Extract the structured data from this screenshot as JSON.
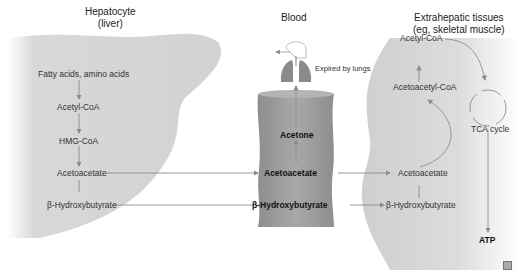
{
  "headers": {
    "liver": [
      "Hepatocyte",
      "(liver)"
    ],
    "blood": "Blood",
    "tissue": [
      "Extrahepatic tissues",
      "(eg, skeletal muscle)"
    ]
  },
  "liver": {
    "items": [
      "Fatty acids, amino acids",
      "Acetyl-CoA",
      "HMG-CoA",
      "Acetoacetate",
      "β-Hydroxybutyrate"
    ]
  },
  "blood": {
    "items": [
      "Acetone",
      "Acetoacetate",
      "β-Hydroxybutyrate"
    ],
    "lungs_label": "Expired by lungs"
  },
  "tissue": {
    "items": [
      "Acetyl-CoA",
      "Acetoacetyl-CoA",
      "Acetoacetate",
      "β-Hydroxybutyrate"
    ],
    "cycle": "TCA cycle",
    "output": "ATP"
  },
  "colors": {
    "shape_fill": "#d6d6d6",
    "cylinder": "#9a9a9a",
    "lungs": "#8a8a8a",
    "arrow": "#8c8c8c"
  }
}
